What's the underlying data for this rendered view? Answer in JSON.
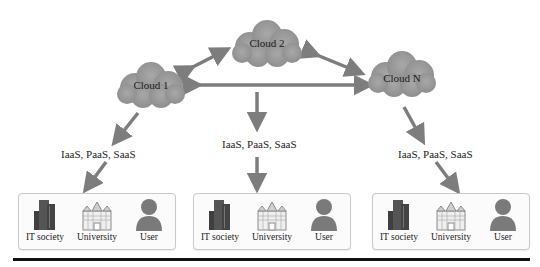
{
  "diagram": {
    "clouds": [
      {
        "id": "cloud1",
        "label": "Cloud 1"
      },
      {
        "id": "cloud2",
        "label": "Cloud 2"
      },
      {
        "id": "cloudN",
        "label": "Cloud N"
      }
    ],
    "service_labels": [
      {
        "text": "IaaS, PaaS, SaaS"
      },
      {
        "text": "IaaS, PaaS, SaaS"
      },
      {
        "text": "IaaS, PaaS, SaaS"
      }
    ],
    "groups": [
      {
        "members": [
          {
            "label": "IT society",
            "icon": "building-icon"
          },
          {
            "label": "University",
            "icon": "university-icon"
          },
          {
            "label": "User",
            "icon": "user-icon"
          }
        ]
      },
      {
        "members": [
          {
            "label": "IT society",
            "icon": "building-icon"
          },
          {
            "label": "University",
            "icon": "university-icon"
          },
          {
            "label": "User",
            "icon": "user-icon"
          }
        ]
      },
      {
        "members": [
          {
            "label": "IT society",
            "icon": "building-icon"
          },
          {
            "label": "University",
            "icon": "university-icon"
          },
          {
            "label": "User",
            "icon": "user-icon"
          }
        ]
      }
    ],
    "colors": {
      "cloud_fill": "#9a9a9a",
      "arrow": "#7d7d7d",
      "building": "#4a4a4a",
      "user": "#7a7a7a"
    }
  }
}
